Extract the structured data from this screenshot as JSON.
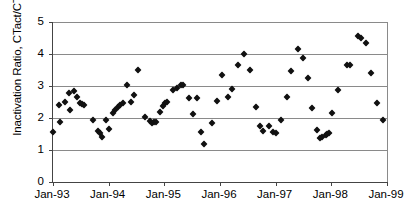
{
  "chart_data": {
    "type": "scatter",
    "title": "",
    "xlabel": "",
    "ylabel": "Inactivation Ratio, CTact/CTreq",
    "xlim": [
      "Jan-93",
      "Jan-99"
    ],
    "ylim": [
      0,
      5
    ],
    "grid": true,
    "legend": null,
    "marker": "filled-diamond",
    "marker_color": "#111111",
    "x_tick_labels": [
      "Jan-93",
      "Jan-94",
      "Jan-95",
      "Jan-96",
      "Jan-97",
      "Jan-98",
      "Jan-99"
    ],
    "y_tick_labels": [
      "0",
      "1",
      "2",
      "3",
      "4",
      "5"
    ],
    "x_tick_values": [
      0,
      1,
      2,
      3,
      4,
      5,
      6
    ],
    "y_tick_values": [
      0,
      1,
      2,
      3,
      4,
      5
    ],
    "x_unit": "years since Jan-93",
    "points": [
      [
        0.0,
        1.56
      ],
      [
        0.1,
        2.42
      ],
      [
        0.13,
        1.88
      ],
      [
        0.22,
        2.5
      ],
      [
        0.28,
        2.78
      ],
      [
        0.3,
        2.26
      ],
      [
        0.37,
        2.83
      ],
      [
        0.43,
        2.65
      ],
      [
        0.48,
        2.48
      ],
      [
        0.52,
        2.43
      ],
      [
        0.56,
        2.4
      ],
      [
        0.72,
        1.94
      ],
      [
        0.8,
        1.6
      ],
      [
        0.84,
        1.53
      ],
      [
        0.88,
        1.41
      ],
      [
        0.95,
        1.95
      ],
      [
        1.0,
        1.66
      ],
      [
        1.08,
        2.17
      ],
      [
        1.12,
        2.25
      ],
      [
        1.17,
        2.34
      ],
      [
        1.21,
        2.41
      ],
      [
        1.25,
        2.47
      ],
      [
        1.33,
        3.04
      ],
      [
        1.4,
        2.5
      ],
      [
        1.46,
        2.72
      ],
      [
        1.52,
        3.49
      ],
      [
        1.66,
        2.03
      ],
      [
        1.74,
        1.92
      ],
      [
        1.78,
        1.85
      ],
      [
        1.81,
        1.86
      ],
      [
        1.85,
        1.88
      ],
      [
        1.92,
        2.2
      ],
      [
        1.97,
        2.36
      ],
      [
        2.01,
        2.48
      ],
      [
        2.05,
        2.5
      ],
      [
        2.16,
        2.88
      ],
      [
        2.22,
        2.95
      ],
      [
        2.3,
        3.03
      ],
      [
        2.34,
        3.03
      ],
      [
        2.44,
        2.64
      ],
      [
        2.52,
        2.11
      ],
      [
        2.58,
        2.61
      ],
      [
        2.66,
        1.57
      ],
      [
        2.72,
        1.2
      ],
      [
        2.86,
        1.83
      ],
      [
        2.95,
        2.53
      ],
      [
        3.03,
        3.34
      ],
      [
        3.14,
        2.67
      ],
      [
        3.22,
        2.92
      ],
      [
        3.33,
        3.66
      ],
      [
        3.44,
        4.0
      ],
      [
        3.54,
        3.49
      ],
      [
        3.64,
        2.34
      ],
      [
        3.72,
        1.75
      ],
      [
        3.78,
        1.58
      ],
      [
        3.88,
        1.74
      ],
      [
        3.95,
        1.56
      ],
      [
        4.0,
        1.52
      ],
      [
        4.1,
        1.95
      ],
      [
        4.2,
        2.66
      ],
      [
        4.28,
        3.48
      ],
      [
        4.4,
        4.15
      ],
      [
        4.49,
        3.89
      ],
      [
        4.58,
        3.24
      ],
      [
        4.66,
        2.31
      ],
      [
        4.74,
        1.63
      ],
      [
        4.8,
        1.38
      ],
      [
        4.84,
        1.4
      ],
      [
        4.9,
        1.47
      ],
      [
        4.93,
        1.51
      ],
      [
        4.96,
        1.53
      ],
      [
        5.02,
        2.15
      ],
      [
        5.12,
        2.87
      ],
      [
        5.28,
        3.66
      ],
      [
        5.33,
        3.67
      ],
      [
        5.48,
        4.55
      ],
      [
        5.54,
        4.5
      ],
      [
        5.62,
        4.33
      ],
      [
        5.72,
        3.42
      ],
      [
        5.82,
        2.48
      ],
      [
        5.93,
        1.94
      ]
    ]
  }
}
